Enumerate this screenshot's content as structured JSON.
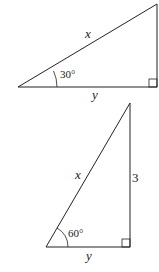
{
  "diagram": {
    "stroke_color": "#222222",
    "triangles": [
      {
        "id": "triangle-1",
        "angle_label": "30°",
        "hypotenuse_label": "x",
        "base_label": "y",
        "right_angle_marker": true
      },
      {
        "id": "triangle-2",
        "angle_label": "60°",
        "hypotenuse_label": "x",
        "base_label": "y",
        "vertical_side_label": "3",
        "right_angle_marker": true
      }
    ]
  }
}
